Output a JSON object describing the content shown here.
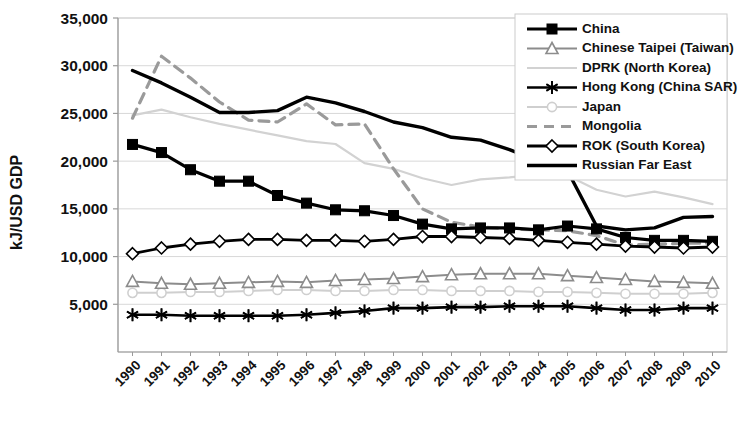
{
  "chart_data": {
    "type": "line",
    "title": "",
    "xlabel": "",
    "ylabel": "kJ/USD GDP",
    "ylim": [
      0,
      35000
    ],
    "yticks": [
      "5,000",
      "10,000",
      "15,000",
      "20,000",
      "25,000",
      "30,000",
      "35,000"
    ],
    "ytick_values": [
      5000,
      10000,
      15000,
      20000,
      25000,
      30000,
      35000
    ],
    "grid": true,
    "legend_position": "top-right",
    "categories": [
      "1990",
      "1991",
      "1992",
      "1993",
      "1994",
      "1995",
      "1996",
      "1997",
      "1998",
      "1999",
      "2000",
      "2001",
      "2002",
      "2003",
      "2004",
      "2005",
      "2006",
      "2007",
      "2008",
      "2009",
      "2010"
    ],
    "x": [
      1990,
      1991,
      1992,
      1993,
      1994,
      1995,
      1996,
      1997,
      1998,
      1999,
      2000,
      2001,
      2002,
      2003,
      2004,
      2005,
      2006,
      2007,
      2008,
      2009,
      2010
    ],
    "series": [
      {
        "name": "China",
        "color": "#000000",
        "marker": "square",
        "dash": "solid",
        "width": 3.2,
        "values": [
          21750,
          20900,
          19100,
          17900,
          17900,
          16400,
          15600,
          14900,
          14800,
          14300,
          13400,
          12900,
          13000,
          13000,
          12800,
          13200,
          12900,
          12000,
          11700,
          11700,
          11600
        ]
      },
      {
        "name": "Chinese Taipei (Taiwan)",
        "color": "#8c8c8c",
        "marker": "triangle",
        "dash": "solid",
        "width": 2.0,
        "values": [
          7400,
          7200,
          7100,
          7200,
          7300,
          7400,
          7300,
          7500,
          7600,
          7700,
          7900,
          8100,
          8200,
          8200,
          8200,
          8000,
          7800,
          7600,
          7400,
          7300,
          7200
        ]
      },
      {
        "name": "DPRK (North Korea)",
        "color": "#d2d2d2",
        "marker": "none",
        "dash": "solid",
        "width": 2.2,
        "values": [
          24800,
          25400,
          24600,
          23900,
          23300,
          22700,
          22100,
          21800,
          19800,
          19200,
          18200,
          17500,
          18100,
          18300,
          18600,
          18500,
          17000,
          16300,
          16800,
          16200,
          15500
        ]
      },
      {
        "name": "Hong Kong (China SAR)",
        "color": "#000000",
        "marker": "asterisk",
        "dash": "solid",
        "width": 2.6,
        "values": [
          3900,
          3900,
          3800,
          3800,
          3800,
          3800,
          3900,
          4100,
          4300,
          4600,
          4600,
          4700,
          4700,
          4800,
          4800,
          4800,
          4600,
          4400,
          4400,
          4600,
          4600
        ]
      },
      {
        "name": "Japan",
        "color": "#cfcfcf",
        "marker": "circle",
        "dash": "solid",
        "width": 2.0,
        "values": [
          6200,
          6200,
          6300,
          6300,
          6400,
          6500,
          6500,
          6400,
          6400,
          6500,
          6500,
          6400,
          6400,
          6400,
          6300,
          6300,
          6200,
          6100,
          6100,
          6100,
          6200
        ]
      },
      {
        "name": "Mongolia",
        "color": "#9a9a9a",
        "marker": "none",
        "dash": "dashed",
        "width": 3.2,
        "values": [
          24500,
          31000,
          28700,
          26200,
          24300,
          24100,
          26000,
          23800,
          23900,
          19200,
          15000,
          13600,
          13100,
          12900,
          12800,
          12700,
          12200,
          11200,
          11300,
          11400,
          11400
        ]
      },
      {
        "name": "ROK (South Korea)",
        "color": "#000000",
        "marker": "diamond",
        "dash": "solid",
        "width": 2.8,
        "values": [
          10300,
          10900,
          11300,
          11600,
          11800,
          11800,
          11700,
          11700,
          11600,
          11800,
          12100,
          12100,
          12000,
          11900,
          11700,
          11500,
          11300,
          11100,
          11000,
          10900,
          11000
        ]
      },
      {
        "name": "Russian Far East",
        "color": "#000000",
        "marker": "none",
        "dash": "solid",
        "width": 3.4,
        "values": [
          29500,
          28200,
          26700,
          25100,
          25100,
          25300,
          26700,
          26100,
          25200,
          24100,
          23500,
          22500,
          22200,
          21200,
          20000,
          19000,
          13200,
          12800,
          13000,
          14100,
          14200
        ]
      }
    ]
  },
  "axes": {
    "y_axis_title": "kJ/USD GDP"
  }
}
